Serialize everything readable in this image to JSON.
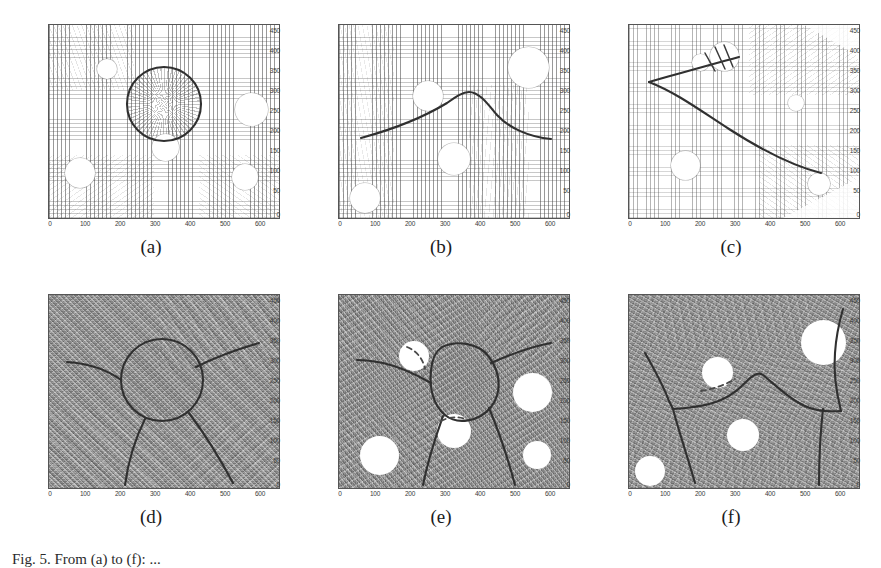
{
  "figure": {
    "caption": "Fig. 5.  From (a) to (f): ...",
    "rows": 2,
    "columns": 3
  },
  "axes": {
    "xticks": [
      "0",
      "100",
      "200",
      "300",
      "400",
      "500",
      "600"
    ],
    "yticks": [
      "0",
      "50",
      "100",
      "150",
      "200",
      "250",
      "300",
      "350",
      "400",
      "450"
    ],
    "xlim": [
      0,
      650
    ],
    "ylim": [
      0,
      480
    ]
  },
  "colors": {
    "curve": "#303030",
    "dashed_curve": "#4a4a4a",
    "obstacle": "#ffffff",
    "frame": "#555555",
    "tick_text": "#3a3a3a",
    "top_field_background": "#ffffff",
    "bottom_field_background": "#8f8f8f"
  },
  "panels": [
    {
      "id": "a",
      "label": "(a)",
      "row": "top",
      "field_type": "quiver",
      "description": "vector field with circular active contour around central blob",
      "obstacles": [
        {
          "cx": 165,
          "cy": 370,
          "r": 26
        },
        {
          "cx": 300,
          "cy": 295,
          "r": 92
        },
        {
          "cx": 560,
          "cy": 270,
          "r": 45
        },
        {
          "cx": 330,
          "cy": 170,
          "r": 36
        },
        {
          "cx": 95,
          "cy": 110,
          "r": 40
        },
        {
          "cx": 555,
          "cy": 100,
          "r": 34
        }
      ],
      "contour": "closed circle centered near (300, 295) radius ~95"
    },
    {
      "id": "b",
      "label": "(b)",
      "row": "top",
      "field_type": "quiver",
      "description": "vector field with open curve crossing horizontally with a central hump",
      "obstacles": [
        {
          "cx": 250,
          "cy": 320,
          "r": 40
        },
        {
          "cx": 540,
          "cy": 400,
          "r": 55
        },
        {
          "cx": 320,
          "cy": 145,
          "r": 43
        },
        {
          "cx": 70,
          "cy": 45,
          "r": 40
        }
      ],
      "contour": "open curve from left edge y~205 rising to peak y~315 at x~330 then down to y~200 at right"
    },
    {
      "id": "c",
      "label": "(c)",
      "row": "top",
      "field_type": "quiver",
      "description": "vector field with cusped curve originating at left, looping up and sweeping down-right",
      "obstacles": [
        {
          "cx": 275,
          "cy": 405,
          "r": 40
        },
        {
          "cx": 205,
          "cy": 375,
          "r": 22
        },
        {
          "cx": 480,
          "cy": 295,
          "r": 20
        },
        {
          "cx": 170,
          "cy": 165,
          "r": 38
        },
        {
          "cx": 545,
          "cy": 105,
          "r": 26
        }
      ],
      "contour": "cusp at x~55 y~330, upper branch to (330,385), lower branch sweeping to (560,155)"
    },
    {
      "id": "d",
      "label": "(d)",
      "row": "bottom",
      "field_type": "speckle",
      "description": "textured field, circular contour with three emanating branches",
      "obstacles": [],
      "contour": "circle center (295,290) radius ~100 with branches to upper-left, upper-right, lower-left, lower-right"
    },
    {
      "id": "e",
      "label": "(e)",
      "row": "bottom",
      "field_type": "speckle",
      "description": "textured field, deformed closed loop with dashed segments and branches",
      "obstacles": [
        {
          "cx": 215,
          "cy": 355,
          "r": 40
        },
        {
          "cx": 545,
          "cy": 285,
          "r": 52
        },
        {
          "cx": 320,
          "cy": 175,
          "r": 45
        },
        {
          "cx": 110,
          "cy": 110,
          "r": 52
        },
        {
          "cx": 560,
          "cy": 100,
          "r": 36
        }
      ],
      "contour": "deformed loop centered (305,320) with dashed arcs over obstacles"
    },
    {
      "id": "f",
      "label": "(f)",
      "row": "bottom",
      "field_type": "speckle",
      "description": "textured field, polyline network crossing the frame with dashed segment",
      "obstacles": [
        {
          "cx": 250,
          "cy": 300,
          "r": 42
        },
        {
          "cx": 545,
          "cy": 400,
          "r": 58
        },
        {
          "cx": 320,
          "cy": 140,
          "r": 38
        },
        {
          "cx": 60,
          "cy": 45,
          "r": 36
        }
      ],
      "contour": "branching polyline: left descending, horizontal mid band y~215, hump at x~345, right ascending"
    }
  ]
}
